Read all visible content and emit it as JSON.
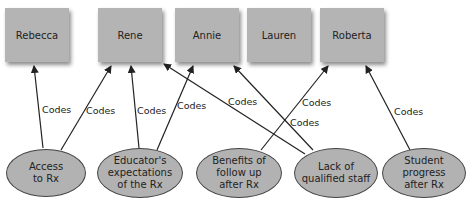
{
  "people": [
    {
      "id": "rebecca",
      "label": "Rebecca",
      "x": 5
    },
    {
      "id": "rene",
      "label": "Rene",
      "x": 98
    },
    {
      "id": "annie",
      "label": "Annie",
      "x": 175
    },
    {
      "id": "lauren",
      "label": "Lauren",
      "x": 247
    },
    {
      "id": "roberta",
      "label": "Roberta",
      "x": 320
    }
  ],
  "themes": [
    {
      "id": "access",
      "label": "Access\nto Rx"
    },
    {
      "id": "educator",
      "label": "Educator's\nexpectations\nof the Rx"
    },
    {
      "id": "benefits",
      "label": "Benefits of\nfollow up\nafter Rx"
    },
    {
      "id": "lack",
      "label": "Lack of\nqualified staff"
    },
    {
      "id": "student",
      "label": "Student\nprogress\nafter Rx"
    }
  ],
  "edge_label": "Codes",
  "edges": [
    {
      "from": "access",
      "to": "rebecca"
    },
    {
      "from": "access",
      "to": "rene"
    },
    {
      "from": "educator",
      "to": "rene"
    },
    {
      "from": "educator",
      "to": "annie"
    },
    {
      "from": "lack",
      "to": "rene"
    },
    {
      "from": "lack",
      "to": "annie"
    },
    {
      "from": "benefits",
      "to": "roberta"
    },
    {
      "from": "student",
      "to": "roberta"
    }
  ],
  "colors": {
    "box": "#b4b4b4",
    "ellipse": "#b2b2b2",
    "line": "#222222"
  }
}
